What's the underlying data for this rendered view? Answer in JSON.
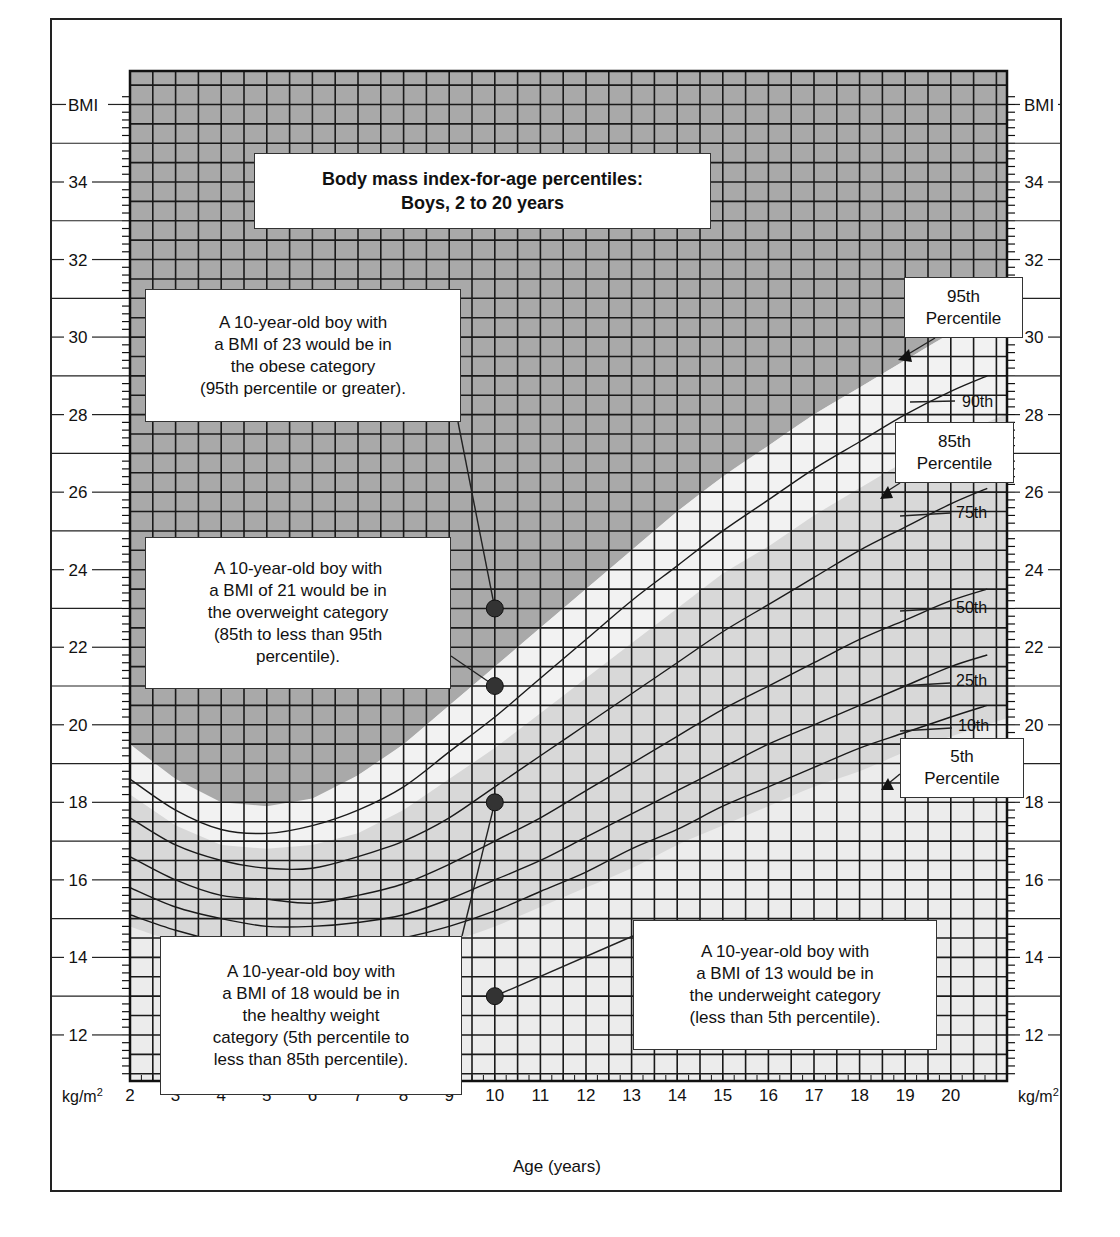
{
  "chart_data": {
    "type": "line",
    "title_lines": [
      "Body mass index-for-age percentiles:",
      "Boys, 2 to 20 years"
    ],
    "xlabel": "Age (years)",
    "ylabel": "BMI",
    "yunit": "kg/m²",
    "xlim": [
      2,
      20.8
    ],
    "ylim": [
      11,
      36.2
    ],
    "x_ticks": [
      2,
      3,
      4,
      5,
      6,
      7,
      8,
      9,
      10,
      11,
      12,
      13,
      14,
      15,
      16,
      17,
      18,
      19,
      20
    ],
    "y_ticks": [
      12,
      14,
      16,
      18,
      20,
      22,
      24,
      26,
      28,
      30,
      32,
      34
    ],
    "grid": true,
    "x": [
      2,
      3,
      4,
      5,
      6,
      7,
      8,
      9,
      10,
      11,
      12,
      13,
      14,
      15,
      16,
      17,
      18,
      19,
      20,
      20.8
    ],
    "series": [
      {
        "name": "95th",
        "values": [
          19.5,
          18.6,
          18.0,
          17.9,
          18.1,
          18.7,
          19.5,
          20.5,
          21.5,
          22.5,
          23.5,
          24.5,
          25.5,
          26.4,
          27.2,
          28.0,
          28.7,
          29.4,
          30.1,
          30.6
        ]
      },
      {
        "name": "90th",
        "values": [
          18.6,
          17.8,
          17.3,
          17.2,
          17.4,
          17.8,
          18.4,
          19.3,
          20.2,
          21.2,
          22.2,
          23.2,
          24.1,
          25.0,
          25.8,
          26.6,
          27.3,
          28.0,
          28.6,
          29.0
        ]
      },
      {
        "name": "85th",
        "values": [
          18.2,
          17.4,
          16.9,
          16.8,
          16.9,
          17.2,
          17.8,
          18.6,
          19.4,
          20.3,
          21.2,
          22.1,
          23.0,
          23.9,
          24.6,
          25.4,
          26.1,
          26.8,
          27.4,
          27.8
        ]
      },
      {
        "name": "75th",
        "values": [
          17.6,
          16.9,
          16.5,
          16.3,
          16.3,
          16.6,
          17.0,
          17.6,
          18.4,
          19.2,
          20.0,
          20.8,
          21.6,
          22.4,
          23.1,
          23.8,
          24.5,
          25.1,
          25.7,
          26.1
        ]
      },
      {
        "name": "50th",
        "values": [
          16.6,
          16.0,
          15.6,
          15.5,
          15.4,
          15.6,
          15.9,
          16.4,
          17.0,
          17.6,
          18.3,
          19.0,
          19.7,
          20.4,
          21.0,
          21.6,
          22.2,
          22.7,
          23.2,
          23.5
        ]
      },
      {
        "name": "25th",
        "values": [
          15.8,
          15.3,
          15.0,
          14.8,
          14.8,
          14.9,
          15.1,
          15.5,
          16.0,
          16.5,
          17.1,
          17.7,
          18.3,
          18.9,
          19.5,
          20.0,
          20.5,
          21.0,
          21.5,
          21.8
        ]
      },
      {
        "name": "10th",
        "values": [
          15.1,
          14.7,
          14.4,
          14.2,
          14.2,
          14.3,
          14.5,
          14.8,
          15.2,
          15.7,
          16.2,
          16.8,
          17.3,
          17.9,
          18.4,
          18.9,
          19.4,
          19.8,
          20.2,
          20.5
        ]
      },
      {
        "name": "5th",
        "values": [
          14.8,
          14.4,
          14.1,
          13.9,
          13.8,
          13.9,
          14.1,
          14.4,
          14.8,
          15.3,
          15.8,
          16.3,
          16.9,
          17.4,
          17.9,
          18.4,
          18.8,
          19.3,
          19.7,
          20.0
        ]
      }
    ],
    "bands": [
      {
        "name": "obese",
        "from": "95th",
        "to": "top",
        "color": "#a9a9a9"
      },
      {
        "name": "overweight",
        "from": "85th",
        "to": "95th",
        "color": "#f1f1f1"
      },
      {
        "name": "healthy",
        "from": "5th",
        "to": "85th",
        "color": "#d9d9d9"
      },
      {
        "name": "underweight",
        "from": "bottom",
        "to": "5th",
        "color": "#ececec"
      }
    ],
    "points": [
      {
        "x": 10,
        "y": 23,
        "category": "obese"
      },
      {
        "x": 10,
        "y": 21,
        "category": "overweight"
      },
      {
        "x": 10,
        "y": 18,
        "category": "healthy weight"
      },
      {
        "x": 10,
        "y": 13,
        "category": "underweight"
      }
    ],
    "line_labels": [
      "90th",
      "75th",
      "50th",
      "25th",
      "10th"
    ],
    "annotations": [
      {
        "id": "obese",
        "text": "A 10-year-old boy with\na BMI of 23 would be in\nthe obese category\n(95th percentile or greater)."
      },
      {
        "id": "overweight",
        "text": "A 10-year-old boy with\na BMI of 21 would be in\nthe overweight category\n(85th to less than 95th\npercentile)."
      },
      {
        "id": "healthy",
        "text": "A 10-year-old boy with\na BMI of 18 would be in\nthe healthy weight\ncategory (5th percentile to\nless than 85th percentile)."
      },
      {
        "id": "underweight",
        "text": "A 10-year-old boy with\na BMI of 13 would be in\nthe underweight category\n(less than 5th percentile)."
      }
    ],
    "percentile_callouts": [
      {
        "id": "p95",
        "text": "95th\nPercentile"
      },
      {
        "id": "p85",
        "text": "85th\nPercentile"
      },
      {
        "id": "p5",
        "text": "5th\nPercentile"
      }
    ]
  },
  "axis": {
    "bmi_label": "BMI",
    "unit_label": "kg/m",
    "unit_sup": "2",
    "x_title": "Age (years)"
  },
  "colors": {
    "grid": "#1a1a1a",
    "curve": "#1a1a1a",
    "dot": "#333333"
  }
}
